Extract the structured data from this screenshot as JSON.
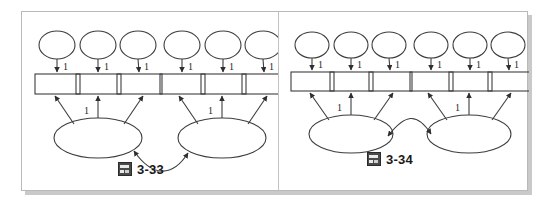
{
  "figure": {
    "background_color": "#ffffff",
    "card_border_color": "#b9b9b9",
    "shadow_color": "#c9c9c9",
    "stroke_color": "#404040"
  },
  "panels": [
    {
      "id": "panel-3-33",
      "caption": {
        "icon": "image-placeholder-icon",
        "label": "3-33"
      },
      "diagram": {
        "type": "path-diagram",
        "errors": [
          {
            "name": "e1",
            "cx": 35,
            "cy": 33,
            "rx": 18,
            "ry": 14
          },
          {
            "name": "e2",
            "cx": 76,
            "cy": 33,
            "rx": 18,
            "ry": 14
          },
          {
            "name": "e3",
            "cx": 116,
            "cy": 33,
            "rx": 18,
            "ry": 14
          },
          {
            "name": "e4",
            "cx": 160,
            "cy": 33,
            "rx": 18,
            "ry": 14
          },
          {
            "name": "e5",
            "cx": 201,
            "cy": 33,
            "rx": 18,
            "ry": 14
          },
          {
            "name": "e6",
            "cx": 241,
            "cy": 33,
            "rx": 18,
            "ry": 14
          }
        ],
        "indicators": [
          {
            "name": "x1",
            "x": 13,
            "y": 62,
            "w": 45,
            "h": 20
          },
          {
            "name": "x2",
            "x": 54,
            "y": 62,
            "w": 45,
            "h": 20
          },
          {
            "name": "x3",
            "x": 95,
            "y": 62,
            "w": 45,
            "h": 20
          },
          {
            "name": "x4",
            "x": 138,
            "y": 62,
            "w": 45,
            "h": 20
          },
          {
            "name": "x5",
            "x": 179,
            "y": 62,
            "w": 45,
            "h": 20
          },
          {
            "name": "x6",
            "x": 220,
            "y": 62,
            "w": 45,
            "h": 20
          }
        ],
        "factors": [
          {
            "name": "F1",
            "cx": 76,
            "cy": 126,
            "rx": 44,
            "ry": 20
          },
          {
            "name": "F2",
            "cx": 200,
            "cy": 126,
            "rx": 44,
            "ry": 20
          }
        ],
        "error_labels": [
          "1",
          "1",
          "1",
          "1",
          "1",
          "1"
        ],
        "loading_labels": [
          "1",
          "1"
        ],
        "covariance": {
          "arrowheads": "both",
          "direction": "downward-arc"
        }
      }
    },
    {
      "id": "panel-3-34",
      "caption": {
        "icon": "image-placeholder-icon",
        "label": "3-34"
      },
      "diagram": {
        "type": "path-diagram",
        "errors": [
          {
            "name": "e1",
            "cx": 33,
            "cy": 33,
            "rx": 17,
            "ry": 13
          },
          {
            "name": "e2",
            "cx": 72,
            "cy": 33,
            "rx": 17,
            "ry": 13
          },
          {
            "name": "e3",
            "cx": 110,
            "cy": 33,
            "rx": 17,
            "ry": 13
          },
          {
            "name": "e4",
            "cx": 152,
            "cy": 33,
            "rx": 17,
            "ry": 13
          },
          {
            "name": "e5",
            "cx": 191,
            "cy": 33,
            "rx": 17,
            "ry": 13
          },
          {
            "name": "e6",
            "cx": 229,
            "cy": 33,
            "rx": 17,
            "ry": 13
          }
        ],
        "indicators": [
          {
            "name": "x1",
            "x": 12,
            "y": 60,
            "w": 43,
            "h": 19
          },
          {
            "name": "x2",
            "x": 51,
            "y": 60,
            "w": 43,
            "h": 19
          },
          {
            "name": "x3",
            "x": 90,
            "y": 60,
            "w": 43,
            "h": 19
          },
          {
            "name": "x4",
            "x": 131,
            "y": 60,
            "w": 43,
            "h": 19
          },
          {
            "name": "x5",
            "x": 170,
            "y": 60,
            "w": 43,
            "h": 19
          },
          {
            "name": "x6",
            "x": 209,
            "y": 60,
            "w": 43,
            "h": 19
          }
        ],
        "factors": [
          {
            "name": "F1",
            "cx": 72,
            "cy": 122,
            "rx": 42,
            "ry": 19
          },
          {
            "name": "F2",
            "cx": 190,
            "cy": 122,
            "rx": 42,
            "ry": 19
          }
        ],
        "error_labels": [
          "1",
          "1",
          "1",
          "1",
          "1",
          "1"
        ],
        "loading_labels": [
          "1",
          "1"
        ],
        "covariance": {
          "arrowheads": "both",
          "direction": "upward-arc"
        }
      }
    }
  ]
}
